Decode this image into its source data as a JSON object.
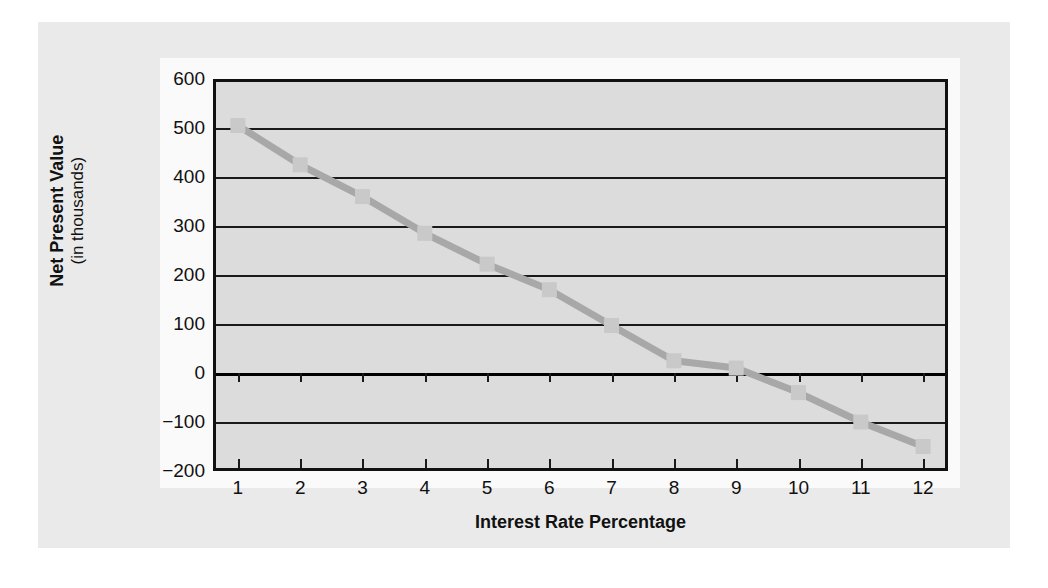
{
  "figure": {
    "background_color": "#eaeaea",
    "plot_background_color": "#dcdcdc",
    "axis_color": "#111111",
    "series_color": "#a8a8a8",
    "marker_color": "#c9c9c9"
  },
  "chart_data": {
    "type": "line",
    "title": "",
    "xlabel": "Interest Rate Percentage",
    "ylabel": "Net Present Value",
    "ylabel_sub": "(in thousands)",
    "x": [
      1,
      2,
      3,
      4,
      5,
      6,
      7,
      8,
      9,
      10,
      11,
      12
    ],
    "categories": [
      "1",
      "2",
      "3",
      "4",
      "5",
      "6",
      "7",
      "8",
      "9",
      "10",
      "11",
      "12"
    ],
    "values": [
      505,
      425,
      360,
      285,
      222,
      170,
      97,
      25,
      10,
      -40,
      -100,
      -150
    ],
    "series": [
      {
        "name": "Net Present Value",
        "values": [
          505,
          425,
          360,
          285,
          222,
          170,
          97,
          25,
          10,
          -40,
          -100,
          -150
        ]
      }
    ],
    "xlim": [
      0.6,
      12.4
    ],
    "ylim": [
      -200,
      600
    ],
    "yticks": [
      600,
      500,
      400,
      300,
      200,
      100,
      0,
      -100,
      -200
    ],
    "ytick_labels": [
      "600",
      "500",
      "400",
      "300",
      "200",
      "100",
      "0",
      "−100",
      "−200"
    ],
    "xticks": [
      1,
      2,
      3,
      4,
      5,
      6,
      7,
      8,
      9,
      10,
      11,
      12
    ],
    "grid": true,
    "grid_axis": "y",
    "legend": false,
    "legend_position": "none",
    "marker": "square",
    "line_style": "solid"
  }
}
